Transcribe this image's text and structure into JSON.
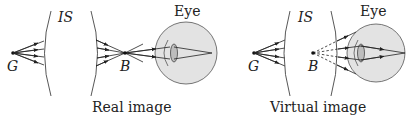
{
  "figure": {
    "panels": [
      {
        "id": "real",
        "caption": "Real image",
        "object_label": "G",
        "optics_label": "IS",
        "image_label": "B",
        "eye_label": "Eye"
      },
      {
        "id": "virtual",
        "caption": "Virtual image",
        "object_label": "G",
        "optics_label": "IS",
        "image_label": "B",
        "eye_label": "Eye"
      }
    ],
    "colors": {
      "line": "#222222",
      "eye_fill": "#e3e3e3",
      "lens_fill": "#bdbdbd"
    }
  }
}
